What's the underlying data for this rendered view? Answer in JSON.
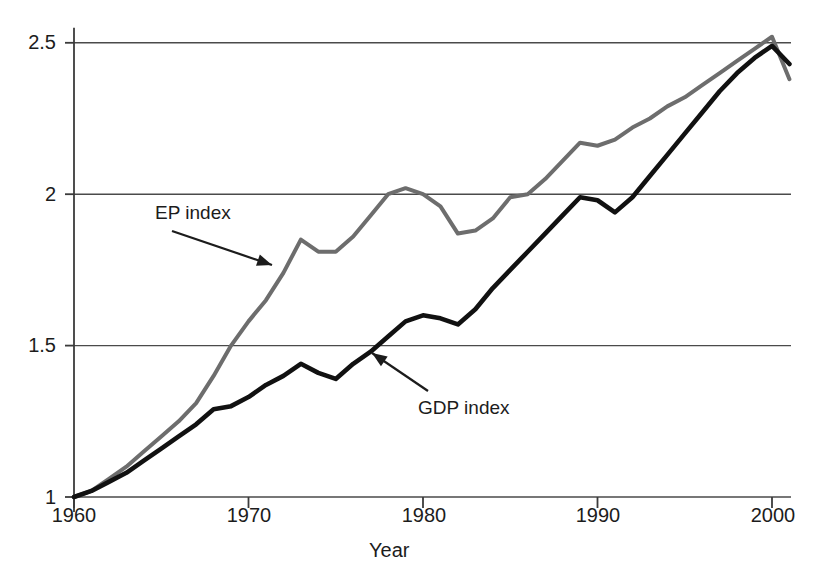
{
  "chart_data": {
    "type": "line",
    "title": "",
    "xlabel": "Year",
    "ylabel": "",
    "xlim": [
      1960,
      2001
    ],
    "ylim": [
      1.0,
      2.55
    ],
    "grid": true,
    "gridlines_y": [
      1,
      1.5,
      2,
      2.5
    ],
    "xticks": [
      1960,
      1970,
      1980,
      1990,
      2000
    ],
    "xtick_labels": [
      "1960",
      "1970",
      "1980",
      "1990",
      "2000"
    ],
    "yticks": [
      1,
      1.5,
      2,
      2.5
    ],
    "ytick_labels": [
      "1",
      "1.5",
      "2",
      "2.5"
    ],
    "legend_position": "inline-annotations",
    "x": [
      1960,
      1961,
      1962,
      1963,
      1964,
      1965,
      1966,
      1967,
      1968,
      1969,
      1970,
      1971,
      1972,
      1973,
      1974,
      1975,
      1976,
      1977,
      1978,
      1979,
      1980,
      1981,
      1982,
      1983,
      1984,
      1985,
      1986,
      1987,
      1988,
      1989,
      1990,
      1991,
      1992,
      1993,
      1994,
      1995,
      1996,
      1997,
      1998,
      1999,
      2000,
      2001
    ],
    "series": [
      {
        "name": "EP index",
        "color": "#6d6d6d",
        "values": [
          1.0,
          1.02,
          1.06,
          1.1,
          1.15,
          1.2,
          1.25,
          1.31,
          1.4,
          1.5,
          1.58,
          1.65,
          1.74,
          1.85,
          1.81,
          1.81,
          1.86,
          1.93,
          2.0,
          2.02,
          2.0,
          1.96,
          1.87,
          1.88,
          1.92,
          1.99,
          2.0,
          2.05,
          2.11,
          2.17,
          2.16,
          2.18,
          2.22,
          2.25,
          2.29,
          2.32,
          2.36,
          2.4,
          2.44,
          2.48,
          2.52,
          2.38
        ]
      },
      {
        "name": "GDP index",
        "color": "#111111",
        "values": [
          1.0,
          1.02,
          1.05,
          1.08,
          1.12,
          1.16,
          1.2,
          1.24,
          1.29,
          1.3,
          1.33,
          1.37,
          1.4,
          1.44,
          1.41,
          1.39,
          1.44,
          1.48,
          1.53,
          1.58,
          1.6,
          1.59,
          1.57,
          1.62,
          1.69,
          1.75,
          1.81,
          1.87,
          1.93,
          1.99,
          1.98,
          1.94,
          1.99,
          2.06,
          2.13,
          2.2,
          2.27,
          2.34,
          2.4,
          2.45,
          2.49,
          2.43
        ]
      }
    ],
    "annotations": [
      {
        "name": "ep-index-annotation",
        "text": "EP index",
        "label_x": 155,
        "label_y": 203,
        "arrow_from_x": 172,
        "arrow_from_y": 231,
        "arrow_to_x": 272,
        "arrow_to_y": 265
      },
      {
        "name": "gdp-index-annotation",
        "text": "GDP index",
        "label_x": 418,
        "label_y": 398,
        "arrow_from_x": 428,
        "arrow_from_y": 391,
        "arrow_to_x": 372,
        "arrow_to_y": 353
      }
    ]
  },
  "axes": {
    "x_title": "Year",
    "x_title_left": 369,
    "x_title_top": 540,
    "y_tick_positions": [
      {
        "label": "1",
        "top": 487,
        "right": 56
      },
      {
        "label": "1.5",
        "top": 335,
        "right": 56
      },
      {
        "label": "2",
        "top": 184,
        "right": 56
      },
      {
        "label": "2.5",
        "top": 32,
        "right": 56
      }
    ],
    "x_tick_positions": [
      {
        "label": "1960",
        "left": 74,
        "top": 505
      },
      {
        "label": "1970",
        "left": 249,
        "top": 505
      },
      {
        "label": "1980",
        "left": 424,
        "top": 505
      },
      {
        "label": "1990",
        "left": 598,
        "top": 505
      },
      {
        "label": "2000",
        "left": 773,
        "top": 505
      }
    ]
  },
  "colors": {
    "ep_line": "#6d6d6d",
    "gdp_line": "#111111",
    "axis": "#3b3b3b",
    "gridline": "#4a4a4a",
    "background": "#ffffff",
    "text": "#1c1c1c"
  }
}
